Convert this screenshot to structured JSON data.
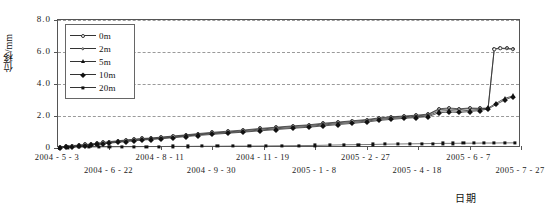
{
  "chart_data": {
    "type": "line",
    "title": "",
    "xlabel": "日期",
    "ylabel": "位移/mm",
    "ylim": [
      0,
      8.0
    ],
    "ytick_labels": [
      "0",
      "2.0",
      "4.0",
      "6.0",
      "8.0"
    ],
    "ytick_values": [
      0,
      2.0,
      4.0,
      6.0,
      8.0
    ],
    "grid": "horizontal-dashed",
    "legend_position": "top-left-inside",
    "xtick_labels": [
      "2004 - 5 - 3",
      "2004 - 6 - 22",
      "2004 - 8 - 11",
      "2004 - 9 - 30",
      "2004 - 11 - 19",
      "2005 - 1 - 8",
      "2005 - 2 - 27",
      "2005 - 4 - 18",
      "2005 - 6 - 7",
      "2005 - 7 - 27"
    ],
    "xtick_positions": [
      0,
      50,
      100,
      150,
      200,
      250,
      300,
      350,
      400,
      450
    ],
    "xlim": [
      0,
      450
    ],
    "series": [
      {
        "name": "0m",
        "marker": "circle-open",
        "x": [
          2,
          8,
          14,
          20,
          26,
          32,
          38,
          44,
          50,
          58,
          66,
          74,
          82,
          90,
          100,
          112,
          124,
          136,
          150,
          165,
          180,
          196,
          212,
          228,
          244,
          258,
          272,
          286,
          300,
          312,
          324,
          336,
          348,
          360,
          370,
          380,
          390,
          400,
          410,
          418,
          424,
          430,
          436,
          442
        ],
        "values": [
          0.05,
          0.1,
          0.15,
          0.18,
          0.22,
          0.25,
          0.3,
          0.35,
          0.4,
          0.45,
          0.5,
          0.55,
          0.6,
          0.62,
          0.68,
          0.75,
          0.82,
          0.9,
          0.98,
          1.05,
          1.12,
          1.22,
          1.3,
          1.38,
          1.45,
          1.55,
          1.62,
          1.7,
          1.78,
          1.88,
          1.95,
          2.0,
          2.05,
          2.12,
          2.45,
          2.5,
          2.45,
          2.5,
          2.48,
          2.5,
          6.2,
          6.25,
          6.22,
          6.2
        ]
      },
      {
        "name": "2m",
        "marker": "circle-small",
        "x": [
          2,
          8,
          14,
          20,
          26,
          32,
          38,
          44,
          50,
          58,
          66,
          74,
          82,
          90,
          100,
          112,
          124,
          136,
          150,
          165,
          180,
          196,
          212,
          228,
          244,
          258,
          272,
          286,
          300,
          312,
          324,
          336,
          348,
          360,
          370,
          380,
          390,
          400,
          410,
          418,
          424,
          430,
          436,
          442
        ],
        "values": [
          0.04,
          0.08,
          0.12,
          0.16,
          0.2,
          0.23,
          0.27,
          0.32,
          0.37,
          0.42,
          0.47,
          0.52,
          0.57,
          0.6,
          0.65,
          0.72,
          0.79,
          0.86,
          0.94,
          1.0,
          1.08,
          1.18,
          1.26,
          1.34,
          1.41,
          1.5,
          1.58,
          1.66,
          1.74,
          1.84,
          1.9,
          1.96,
          2.0,
          2.08,
          2.4,
          2.44,
          2.4,
          2.46,
          2.44,
          2.46,
          6.18,
          6.22,
          6.2,
          6.18
        ]
      },
      {
        "name": "5m",
        "marker": "triangle-filled",
        "x": [
          2,
          8,
          14,
          20,
          26,
          32,
          38,
          44,
          50,
          58,
          66,
          74,
          82,
          90,
          100,
          112,
          124,
          136,
          150,
          165,
          180,
          196,
          212,
          228,
          244,
          258,
          272,
          286,
          300,
          312,
          324,
          336,
          348,
          360,
          370,
          380,
          390,
          400,
          410,
          418,
          426,
          434,
          442
        ],
        "values": [
          0.03,
          0.06,
          0.1,
          0.13,
          0.17,
          0.2,
          0.24,
          0.28,
          0.33,
          0.38,
          0.43,
          0.48,
          0.53,
          0.56,
          0.61,
          0.68,
          0.75,
          0.82,
          0.9,
          0.96,
          1.03,
          1.12,
          1.2,
          1.28,
          1.35,
          1.44,
          1.52,
          1.6,
          1.68,
          1.78,
          1.85,
          1.9,
          1.95,
          2.02,
          2.3,
          2.34,
          2.3,
          2.36,
          2.4,
          2.5,
          2.8,
          3.1,
          3.25
        ]
      },
      {
        "name": "10m",
        "marker": "diamond-filled",
        "x": [
          2,
          8,
          14,
          20,
          26,
          32,
          38,
          44,
          50,
          58,
          66,
          74,
          82,
          90,
          100,
          112,
          124,
          136,
          150,
          165,
          180,
          196,
          212,
          228,
          244,
          258,
          272,
          286,
          300,
          312,
          324,
          336,
          348,
          360,
          370,
          380,
          390,
          400,
          410,
          418,
          426,
          434,
          442
        ],
        "values": [
          0.02,
          0.05,
          0.08,
          0.11,
          0.15,
          0.18,
          0.22,
          0.26,
          0.3,
          0.35,
          0.4,
          0.45,
          0.5,
          0.53,
          0.58,
          0.64,
          0.71,
          0.78,
          0.85,
          0.92,
          0.99,
          1.07,
          1.15,
          1.23,
          1.3,
          1.38,
          1.46,
          1.54,
          1.62,
          1.72,
          1.79,
          1.85,
          1.9,
          1.96,
          2.2,
          2.25,
          2.22,
          2.28,
          2.34,
          2.44,
          2.72,
          3.0,
          3.2
        ]
      },
      {
        "name": "20m",
        "marker": "square-filled",
        "x": [
          2,
          10,
          20,
          30,
          40,
          50,
          62,
          74,
          86,
          98,
          112,
          126,
          140,
          155,
          170,
          186,
          202,
          218,
          234,
          250,
          264,
          278,
          292,
          306,
          318,
          330,
          342,
          354,
          364,
          374,
          384,
          394,
          404,
          414,
          424,
          434,
          444
        ],
        "values": [
          0.02,
          0.04,
          0.05,
          0.06,
          0.07,
          0.07,
          0.08,
          0.08,
          0.09,
          0.09,
          0.1,
          0.1,
          0.11,
          0.11,
          0.12,
          0.12,
          0.13,
          0.14,
          0.15,
          0.16,
          0.18,
          0.2,
          0.21,
          0.22,
          0.24,
          0.25,
          0.26,
          0.27,
          0.28,
          0.29,
          0.29,
          0.3,
          0.3,
          0.31,
          0.31,
          0.32,
          0.32
        ]
      }
    ]
  },
  "legend": {
    "items": [
      {
        "label": "0m"
      },
      {
        "label": "2m"
      },
      {
        "label": "5m"
      },
      {
        "label": "10m"
      },
      {
        "label": "20m"
      }
    ]
  },
  "axes": {
    "y_title": "位移/mm",
    "x_title": "日期"
  },
  "colors": {
    "line": "#333333",
    "grid": "#9a9a9a",
    "frame": "#555555",
    "background": "#ffffff"
  }
}
